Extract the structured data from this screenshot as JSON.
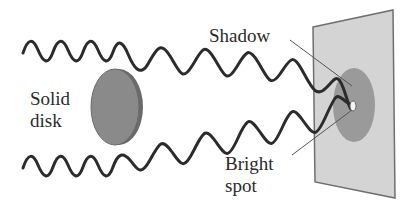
{
  "diagram": {
    "labels": {
      "disk_line1": "Solid",
      "disk_line2": "disk",
      "shadow": "Shadow",
      "bright_line1": "Bright",
      "bright_line2": "spot"
    },
    "colors": {
      "wave": "#2b2b2b",
      "disk_face": "#8a8a8a",
      "disk_edge": "#6a6a6a",
      "screen": "#d4d4d4",
      "screen_border": "#6f6f6f",
      "shadow": "#9a9a9a",
      "bright_spot": "#f4f4f4",
      "leader_line": "#555555",
      "text": "#2a2a2a"
    },
    "elements": [
      {
        "name": "incoming-wave-top",
        "type": "wave"
      },
      {
        "name": "incoming-wave-bottom",
        "type": "wave"
      },
      {
        "name": "solid-disk",
        "type": "obstacle"
      },
      {
        "name": "screen",
        "type": "plane"
      },
      {
        "name": "shadow-region",
        "type": "ellipse"
      },
      {
        "name": "bright-spot",
        "type": "point"
      }
    ]
  }
}
